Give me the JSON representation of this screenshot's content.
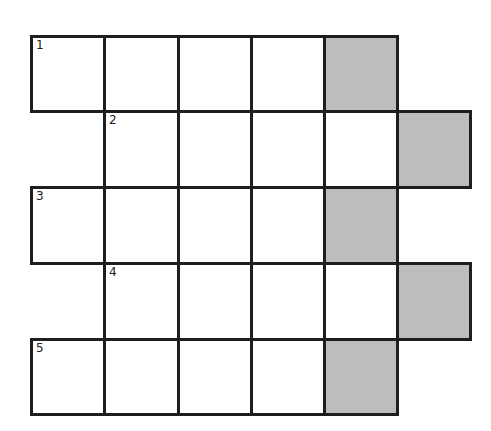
{
  "puzzle": {
    "colors": {
      "shade": "#bdbdbd",
      "line": "#1e1e1e"
    },
    "rows": [
      {
        "number": "1",
        "start_col": 0,
        "cells": 5,
        "shaded_col": 4
      },
      {
        "number": "2",
        "start_col": 1,
        "cells": 5,
        "shaded_col": 5
      },
      {
        "number": "3",
        "start_col": 0,
        "cells": 5,
        "shaded_col": 4
      },
      {
        "number": "4",
        "start_col": 1,
        "cells": 5,
        "shaded_col": 5
      },
      {
        "number": "5",
        "start_col": 0,
        "cells": 5,
        "shaded_col": 4
      }
    ]
  }
}
